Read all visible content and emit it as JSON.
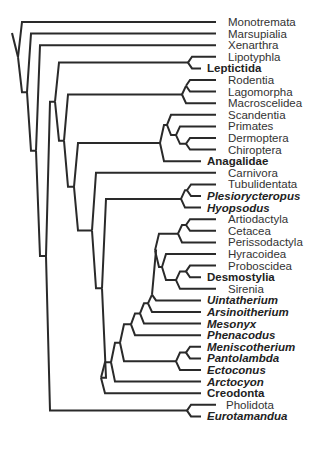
{
  "diagram": {
    "type": "cladogram",
    "line_color": "#2a2a2a",
    "text_color": "#333333",
    "leaves": [
      {
        "label": "Monotremata",
        "style": "normal"
      },
      {
        "label": "Marsupialia",
        "style": "normal"
      },
      {
        "label": "Xenarthra",
        "style": "normal"
      },
      {
        "label": "Lipotyphla",
        "style": "normal"
      },
      {
        "label": "Leptictida",
        "style": "bold"
      },
      {
        "label": "Rodentia",
        "style": "normal"
      },
      {
        "label": "Lagomorpha",
        "style": "normal"
      },
      {
        "label": "Macroscelidea",
        "style": "normal"
      },
      {
        "label": "Scandentia",
        "style": "normal"
      },
      {
        "label": "Primates",
        "style": "normal"
      },
      {
        "label": "Dermoptera",
        "style": "normal"
      },
      {
        "label": "Chiroptera",
        "style": "normal"
      },
      {
        "label": "Anagalidae",
        "style": "bold"
      },
      {
        "label": "Carnivora",
        "style": "normal"
      },
      {
        "label": "Tubulidentata",
        "style": "normal"
      },
      {
        "label": "Plesiorycteropus",
        "style": "bold-italic"
      },
      {
        "label": "Hyopsodus",
        "style": "bold-italic"
      },
      {
        "label": "Artiodactyla",
        "style": "normal"
      },
      {
        "label": "Cetacea",
        "style": "normal"
      },
      {
        "label": "Perissodactyla",
        "style": "normal"
      },
      {
        "label": "Hyracoidea",
        "style": "normal"
      },
      {
        "label": "Proboscidea",
        "style": "normal"
      },
      {
        "label": "Desmostylia",
        "style": "bold"
      },
      {
        "label": "Sirenia",
        "style": "normal"
      },
      {
        "label": "Uintatherium",
        "style": "bold-italic"
      },
      {
        "label": "Arsinoitherium",
        "style": "bold-italic"
      },
      {
        "label": "Mesonyx",
        "style": "bold-italic"
      },
      {
        "label": "Phenacodus",
        "style": "bold-italic"
      },
      {
        "label": "Meniscotherium",
        "style": "bold-italic"
      },
      {
        "label": "Pantolambda",
        "style": "bold-italic"
      },
      {
        "label": "Ectoconus",
        "style": "bold-italic"
      },
      {
        "label": "Arctocyon",
        "style": "bold-italic"
      },
      {
        "label": "Creodonta",
        "style": "bold"
      },
      {
        "label": "Pholidota",
        "style": "normal"
      },
      {
        "label": "Eurotamandua",
        "style": "bold-italic"
      }
    ]
  }
}
